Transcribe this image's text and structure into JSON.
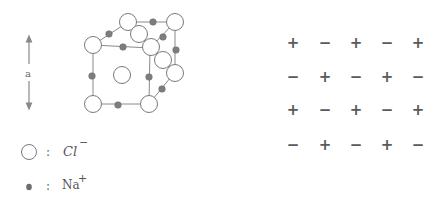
{
  "figure": {
    "dimension_label": "a",
    "legend": [
      {
        "symbol": "open-circle",
        "ion": "Cl",
        "charge": "−",
        "separator": ":"
      },
      {
        "symbol": "filled-dot",
        "ion": "Na",
        "charge": "+",
        "separator": ":"
      }
    ],
    "colors": {
      "line": "#8a8a8a",
      "chloride_fill": "#ffffff",
      "chloride_stroke": "#7a7a7a",
      "sodium_fill": "#7d7d7d",
      "sign": "#5a5a5a"
    },
    "charge_grid": {
      "rows": [
        [
          "+",
          "−",
          "+",
          "−",
          "+"
        ],
        [
          "−",
          "+",
          "−",
          "+",
          "−"
        ],
        [
          "+",
          "−",
          "+",
          "−",
          "+"
        ],
        [
          "−",
          "+",
          "−",
          "+",
          "−"
        ]
      ]
    }
  }
}
